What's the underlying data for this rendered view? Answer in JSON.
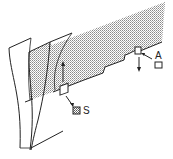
{
  "diagram": {
    "labels": {
      "s": "S",
      "a": "A"
    },
    "legend_boxes": {
      "s": {
        "fill": "hatched"
      },
      "a": {
        "fill": "empty"
      }
    },
    "colors": {
      "line": "#222222",
      "shade_dot": "#8a8a8a",
      "background": "#ffffff"
    }
  }
}
